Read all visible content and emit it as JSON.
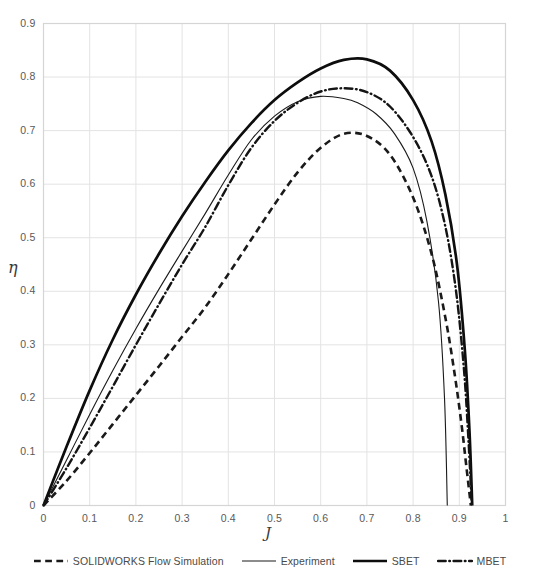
{
  "chart_data": {
    "type": "line",
    "title": "",
    "xlabel": "J",
    "ylabel": "η",
    "xlim": [
      0,
      1
    ],
    "ylim": [
      0,
      0.9
    ],
    "grid": true,
    "legend_position": "bottom",
    "xticks": [
      "0",
      "0.1",
      "0.2",
      "0.3",
      "0.4",
      "0.5",
      "0.6",
      "0.7",
      "0.8",
      "0.9",
      "1"
    ],
    "xtick_values": [
      0,
      0.1,
      0.2,
      0.3,
      0.4,
      0.5,
      0.6,
      0.7,
      0.8,
      0.9,
      1
    ],
    "yticks": [
      "0",
      "0.1",
      "0.2",
      "0.3",
      "0.4",
      "0.5",
      "0.6",
      "0.7",
      "0.8",
      "0.9"
    ],
    "ytick_values": [
      0,
      0.1,
      0.2,
      0.3,
      0.4,
      0.5,
      0.6,
      0.7,
      0.8,
      0.9
    ],
    "series": [
      {
        "name": "SOLIDWORKS Flow Simulation",
        "style": "dashed",
        "color": "#1a1a1a",
        "width": 2.6,
        "x": [
          0,
          0.05,
          0.1,
          0.15,
          0.2,
          0.25,
          0.3,
          0.35,
          0.4,
          0.45,
          0.5,
          0.55,
          0.6,
          0.65,
          0.7,
          0.75,
          0.8,
          0.84,
          0.87,
          0.89,
          0.905,
          0.915,
          0.925
        ],
        "y": [
          0,
          0.046,
          0.098,
          0.152,
          0.206,
          0.26,
          0.315,
          0.37,
          0.432,
          0.497,
          0.562,
          0.622,
          0.668,
          0.694,
          0.69,
          0.655,
          0.575,
          0.47,
          0.35,
          0.245,
          0.15,
          0.075,
          0.0
        ]
      },
      {
        "name": "Experiment",
        "style": "solid-thin",
        "color": "#1a1a1a",
        "width": 1.1,
        "x": [
          0,
          0.05,
          0.1,
          0.15,
          0.2,
          0.25,
          0.3,
          0.35,
          0.4,
          0.45,
          0.5,
          0.55,
          0.6,
          0.65,
          0.68,
          0.72,
          0.76,
          0.8,
          0.83,
          0.855,
          0.868,
          0.874
        ],
        "y": [
          0,
          0.085,
          0.17,
          0.252,
          0.33,
          0.404,
          0.475,
          0.545,
          0.617,
          0.683,
          0.727,
          0.754,
          0.764,
          0.76,
          0.752,
          0.731,
          0.694,
          0.63,
          0.53,
          0.38,
          0.2,
          0.0
        ]
      },
      {
        "name": "SBET",
        "style": "solid-thick",
        "color": "#0d0d0d",
        "width": 2.7,
        "x": [
          0,
          0.05,
          0.1,
          0.15,
          0.2,
          0.25,
          0.3,
          0.35,
          0.4,
          0.45,
          0.5,
          0.55,
          0.6,
          0.65,
          0.7,
          0.75,
          0.8,
          0.84,
          0.87,
          0.895,
          0.912,
          0.922,
          0.928
        ],
        "y": [
          0,
          0.11,
          0.215,
          0.31,
          0.394,
          0.47,
          0.54,
          0.604,
          0.663,
          0.714,
          0.757,
          0.79,
          0.816,
          0.832,
          0.833,
          0.812,
          0.757,
          0.68,
          0.58,
          0.45,
          0.29,
          0.14,
          0.0
        ]
      },
      {
        "name": "MBET",
        "style": "dash-dot",
        "color": "#141414",
        "width": 2.4,
        "x": [
          0,
          0.05,
          0.1,
          0.15,
          0.2,
          0.25,
          0.3,
          0.35,
          0.4,
          0.45,
          0.5,
          0.55,
          0.6,
          0.65,
          0.7,
          0.75,
          0.8,
          0.84,
          0.87,
          0.893,
          0.91,
          0.92,
          0.927
        ],
        "y": [
          0,
          0.07,
          0.145,
          0.222,
          0.3,
          0.376,
          0.45,
          0.52,
          0.598,
          0.668,
          0.718,
          0.752,
          0.773,
          0.779,
          0.772,
          0.745,
          0.688,
          0.615,
          0.52,
          0.4,
          0.255,
          0.12,
          0.0
        ]
      }
    ]
  },
  "legend": {
    "items": [
      {
        "label": "SOLIDWORKS Flow Simulation",
        "style": "dashed"
      },
      {
        "label": "Experiment",
        "style": "solid-thin"
      },
      {
        "label": "SBET",
        "style": "solid-thick"
      },
      {
        "label": "MBET",
        "style": "dash-dot"
      }
    ]
  },
  "axes": {
    "y_axis_title": "η",
    "x_axis_title": "J"
  },
  "colors": {
    "gridline": "#e3e3e3",
    "axis": "#d5d5d5",
    "text": "#595959",
    "curve": "#1a1a1a"
  }
}
